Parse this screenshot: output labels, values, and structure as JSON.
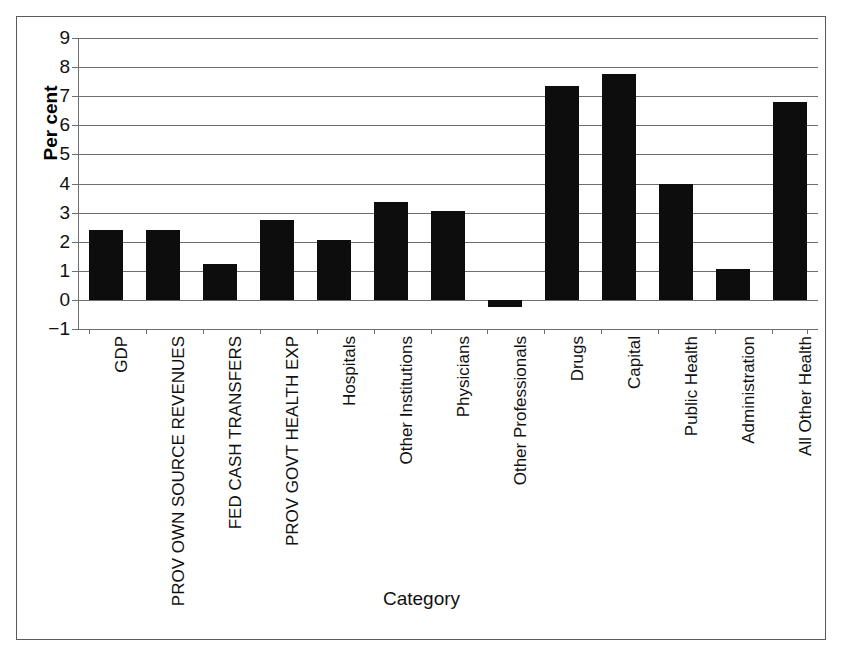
{
  "chart_data": {
    "type": "bar",
    "title": "",
    "xlabel": "Category",
    "ylabel": "Per cent",
    "ylim": [
      -1,
      9
    ],
    "yticks": [
      9,
      8,
      7,
      6,
      5,
      4,
      3,
      2,
      1,
      0,
      -1
    ],
    "ytick_labels": [
      "9",
      "8",
      "7",
      "6",
      "5",
      "4",
      "3",
      "2",
      "1",
      "0",
      "−1"
    ],
    "grid": true,
    "legend": false,
    "bar_color": "#0d0d0d",
    "categories": [
      "GDP",
      "PROV OWN SOURCE REVENUES",
      "FED CASH TRANSFERS",
      "PROV GOVT HEALTH EXP",
      "Hospitals",
      "Other Institutions",
      "Physicians",
      "Other Professionals",
      "Drugs",
      "Capital",
      "Public Health",
      "Administration",
      "All Other Health"
    ],
    "values": [
      2.4,
      2.4,
      1.25,
      2.75,
      2.05,
      3.35,
      3.05,
      -0.25,
      7.35,
      7.75,
      4.0,
      1.05,
      6.8
    ]
  }
}
